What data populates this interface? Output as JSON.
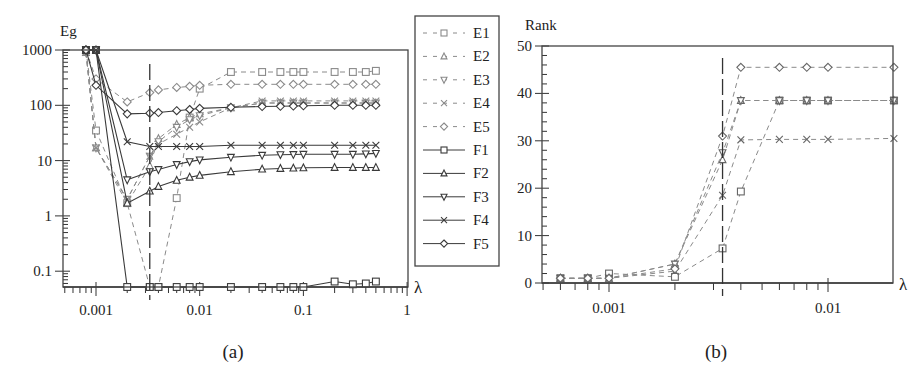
{
  "figure": {
    "captions": [
      "(a)",
      "(b)"
    ],
    "legend": {
      "entries": [
        {
          "label": "E1",
          "marker": "square",
          "line": "dashed"
        },
        {
          "label": "E2",
          "marker": "triangle-up",
          "line": "dashed"
        },
        {
          "label": "E3",
          "marker": "triangle-down",
          "line": "dashed"
        },
        {
          "label": "E4",
          "marker": "x",
          "line": "dashed"
        },
        {
          "label": "E5",
          "marker": "diamond",
          "line": "dashed"
        },
        {
          "label": "F1",
          "marker": "square",
          "line": "solid"
        },
        {
          "label": "F2",
          "marker": "triangle-up",
          "line": "solid"
        },
        {
          "label": "F3",
          "marker": "triangle-down",
          "line": "solid"
        },
        {
          "label": "F4",
          "marker": "x",
          "line": "solid"
        },
        {
          "label": "F5",
          "marker": "diamond",
          "line": "solid"
        }
      ]
    },
    "colors": {
      "solid": "#3a3a3a",
      "dashed": "#8a8a8a",
      "frame": "#444444"
    }
  },
  "chart_data": [
    {
      "id": "a",
      "type": "line",
      "caption": "(a)",
      "title": "",
      "xlabel": "λ",
      "ylabel": "Eg",
      "xscale": "log",
      "yscale": "log",
      "xlim": [
        0.0005,
        1
      ],
      "ylim": [
        0.05,
        1000
      ],
      "xticks": [
        0.001,
        0.01,
        0.1,
        1
      ],
      "xtick_labels": [
        "0.001",
        "0.01",
        "0.1",
        "1"
      ],
      "yticks": [
        0.1,
        1,
        10,
        100,
        1000
      ],
      "ytick_labels": [
        "0.1",
        "1",
        "10",
        "100",
        "1000"
      ],
      "grid": false,
      "vline": 0.0033,
      "legend_position": "right (outside)",
      "series": [
        {
          "name": "E1",
          "x": [
            0.0008,
            0.001,
            0.002,
            0.0033,
            0.004,
            0.006,
            0.008,
            0.01,
            0.02,
            0.04,
            0.06,
            0.08,
            0.1,
            0.2,
            0.3,
            0.4,
            0.5
          ],
          "y": [
            1000,
            35,
            1.7,
            0.05,
            0.05,
            2.1,
            60,
            200,
            400,
            400,
            400,
            400,
            400,
            400,
            400,
            400,
            420
          ]
        },
        {
          "name": "E2",
          "x": [
            0.0008,
            0.001,
            0.002,
            0.0033,
            0.004,
            0.006,
            0.008,
            0.01,
            0.02,
            0.04,
            0.06,
            0.08,
            0.1,
            0.2,
            0.3,
            0.4,
            0.5
          ],
          "y": [
            900,
            17,
            1.7,
            8,
            25,
            45,
            60,
            70,
            90,
            110,
            110,
            110,
            110,
            110,
            110,
            110,
            110
          ]
        },
        {
          "name": "E3",
          "x": [
            0.0008,
            0.001,
            0.002,
            0.0033,
            0.004,
            0.006,
            0.008,
            0.01,
            0.02,
            0.04,
            0.06,
            0.08,
            0.1,
            0.2,
            0.3,
            0.4,
            0.5
          ],
          "y": [
            900,
            17,
            2,
            12,
            22,
            40,
            55,
            65,
            90,
            110,
            110,
            110,
            110,
            110,
            110,
            110,
            110
          ]
        },
        {
          "name": "E4",
          "x": [
            0.0008,
            0.001,
            0.002,
            0.0033,
            0.004,
            0.006,
            0.008,
            0.01,
            0.02,
            0.04,
            0.06,
            0.08,
            0.1,
            0.2,
            0.3,
            0.4,
            0.5
          ],
          "y": [
            900,
            17,
            2,
            12,
            20,
            30,
            40,
            50,
            90,
            120,
            120,
            120,
            120,
            120,
            120,
            120,
            120
          ]
        },
        {
          "name": "E5",
          "x": [
            0.0008,
            0.001,
            0.002,
            0.0033,
            0.004,
            0.006,
            0.008,
            0.01,
            0.02,
            0.04,
            0.06,
            0.08,
            0.1,
            0.2,
            0.3,
            0.4,
            0.5
          ],
          "y": [
            1000,
            300,
            115,
            170,
            190,
            210,
            220,
            230,
            240,
            240,
            240,
            240,
            240,
            240,
            240,
            240,
            240
          ]
        },
        {
          "name": "F1",
          "x": [
            0.0008,
            0.001,
            0.002,
            0.0033,
            0.004,
            0.006,
            0.008,
            0.01,
            0.02,
            0.04,
            0.06,
            0.08,
            0.1,
            0.2,
            0.3,
            0.4,
            0.5
          ],
          "y": [
            1000,
            1000,
            0.05,
            0.05,
            0.05,
            0.05,
            0.05,
            0.05,
            0.05,
            0.05,
            0.05,
            0.05,
            0.05,
            0.065,
            0.058,
            0.06,
            0.065
          ]
        },
        {
          "name": "F2",
          "x": [
            0.0008,
            0.001,
            0.002,
            0.0033,
            0.004,
            0.006,
            0.008,
            0.01,
            0.02,
            0.04,
            0.06,
            0.08,
            0.1,
            0.2,
            0.3,
            0.4,
            0.5
          ],
          "y": [
            1000,
            1000,
            1.7,
            2.8,
            3.4,
            4.4,
            5.0,
            5.4,
            6.3,
            7.0,
            7.2,
            7.3,
            7.4,
            7.5,
            7.5,
            7.5,
            7.5
          ]
        },
        {
          "name": "F3",
          "x": [
            0.0008,
            0.001,
            0.002,
            0.0033,
            0.004,
            0.006,
            0.008,
            0.01,
            0.02,
            0.04,
            0.06,
            0.08,
            0.1,
            0.2,
            0.3,
            0.4,
            0.5
          ],
          "y": [
            1000,
            1000,
            4.5,
            6.3,
            6.9,
            8.5,
            9.6,
            10.3,
            11.5,
            12.5,
            12.8,
            12.9,
            13,
            13,
            13,
            13.2,
            13.5
          ]
        },
        {
          "name": "F4",
          "x": [
            0.0008,
            0.001,
            0.002,
            0.0033,
            0.004,
            0.006,
            0.008,
            0.01,
            0.02,
            0.04,
            0.06,
            0.08,
            0.1,
            0.2,
            0.3,
            0.4,
            0.5
          ],
          "y": [
            1000,
            1000,
            22,
            18,
            18,
            18,
            18,
            18,
            19,
            19,
            19,
            19,
            19,
            19,
            19,
            19,
            19
          ]
        },
        {
          "name": "F5",
          "x": [
            0.0008,
            0.001,
            0.002,
            0.0033,
            0.004,
            0.006,
            0.008,
            0.01,
            0.02,
            0.04,
            0.06,
            0.08,
            0.1,
            0.2,
            0.3,
            0.4,
            0.5
          ],
          "y": [
            1000,
            230,
            70,
            72,
            74,
            80,
            84,
            88,
            92,
            95,
            96,
            97,
            98,
            100,
            100,
            100,
            100
          ]
        }
      ]
    },
    {
      "id": "b",
      "type": "line",
      "caption": "(b)",
      "title": "",
      "xlabel": "λ",
      "ylabel": "Rank",
      "xscale": "log",
      "yscale": "linear",
      "xlim": [
        0.0005,
        0.02
      ],
      "ylim": [
        0,
        50
      ],
      "xticks": [
        0.001,
        0.01
      ],
      "xtick_labels": [
        "0.001",
        "0.01"
      ],
      "yticks": [
        0,
        10,
        20,
        30,
        40,
        50
      ],
      "ytick_labels": [
        "0",
        "10",
        "20",
        "30",
        "40",
        "50"
      ],
      "grid": false,
      "vline": 0.0033,
      "series": [
        {
          "name": "E1",
          "x": [
            0.0006,
            0.0008,
            0.001,
            0.002,
            0.0033,
            0.004,
            0.006,
            0.008,
            0.01,
            0.02
          ],
          "y": [
            1,
            1,
            2,
            1.3,
            7.3,
            19.3,
            38.5,
            38.5,
            38.5,
            38.5
          ]
        },
        {
          "name": "E2",
          "x": [
            0.0006,
            0.0008,
            0.001,
            0.002,
            0.0033,
            0.004,
            0.006,
            0.008,
            0.01,
            0.02
          ],
          "y": [
            1,
            1,
            1,
            4,
            26,
            38.5,
            38.5,
            38.5,
            38.5,
            38.5
          ]
        },
        {
          "name": "E3",
          "x": [
            0.0006,
            0.0008,
            0.001,
            0.002,
            0.0033,
            0.004,
            0.006,
            0.008,
            0.01,
            0.02
          ],
          "y": [
            1,
            1,
            1,
            4,
            27.5,
            38.5,
            38.5,
            38.5,
            38.5,
            38.5
          ]
        },
        {
          "name": "E4",
          "x": [
            0.0006,
            0.0008,
            0.001,
            0.002,
            0.0033,
            0.004,
            0.006,
            0.008,
            0.01,
            0.02
          ],
          "y": [
            1,
            1,
            1,
            2.5,
            18.5,
            30.2,
            30.3,
            30.3,
            30.3,
            30.5
          ]
        },
        {
          "name": "E5",
          "x": [
            0.0006,
            0.0008,
            0.001,
            0.002,
            0.0033,
            0.004,
            0.006,
            0.008,
            0.01,
            0.02
          ],
          "y": [
            1,
            1,
            1,
            3,
            31,
            45.5,
            45.5,
            45.5,
            45.5,
            45.5
          ]
        }
      ]
    }
  ]
}
